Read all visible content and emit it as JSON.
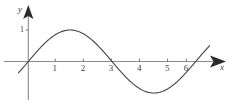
{
  "chart_data": {
    "type": "line",
    "title": "",
    "subtitle": "",
    "xlabel": "x",
    "ylabel": "y",
    "grid": false,
    "legend": null,
    "xlim": [
      -0.4,
      6.9
    ],
    "ylim": [
      -1.45,
      1.45
    ],
    "xticks": [
      1,
      2,
      3,
      4,
      5,
      6
    ],
    "xtick_labels": [
      "1",
      "2",
      "3",
      "4",
      "5",
      "6"
    ],
    "yticks": [
      1
    ],
    "ytick_labels": [
      "1"
    ],
    "series": [
      {
        "name": "curve",
        "equation": "y = sin(pi*x/3)",
        "color": "#4a4a4a",
        "x": [
          -0.35,
          0,
          0.3,
          0.6,
          0.9,
          1.2,
          1.5,
          1.8,
          2.1,
          2.4,
          2.7,
          3.0,
          3.3,
          3.6,
          3.9,
          4.2,
          4.5,
          4.8,
          5.1,
          5.4,
          5.7,
          6.0,
          6.3,
          6.5
        ],
        "y": [
          -0.36,
          0,
          0.31,
          0.59,
          0.81,
          0.95,
          1.0,
          0.95,
          0.81,
          0.59,
          0.31,
          0,
          -0.31,
          -0.59,
          -0.81,
          -0.95,
          -1.0,
          -0.95,
          -0.81,
          -0.59,
          -0.31,
          0,
          0.31,
          0.5
        ]
      }
    ],
    "features": {
      "x_intercepts": [
        0,
        3,
        6
      ],
      "maximum": {
        "x": 1.5,
        "y": 1
      },
      "minimum": {
        "x": 4.5,
        "y": -1
      },
      "period": 6,
      "amplitude": 1
    }
  },
  "axes": {
    "x_axis_arrow": "arrowhead-right",
    "y_axis_arrow": "arrowhead-up",
    "x_label": "x",
    "y_label": "y",
    "y_unit_label": "1",
    "axis_color": "#7a7a7a",
    "curve_color": "#4a4a4a",
    "tick_color": "#6b6b6b",
    "background": "#ffffff"
  }
}
